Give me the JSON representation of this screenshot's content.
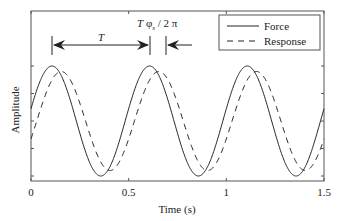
{
  "chart_data": {
    "type": "line",
    "title": "",
    "xlabel": "Time (s)",
    "ylabel": "Amplitude",
    "xlim": [
      0,
      1.5
    ],
    "ylim": [
      -1.1,
      1.1
    ],
    "x_ticks": [
      0,
      0.5,
      1,
      1.5
    ],
    "x_tick_labels": [
      "0",
      "0.5",
      "1",
      "1.5"
    ],
    "y_ticks": [
      -1,
      -0.5,
      0,
      0.5,
      1
    ],
    "y_tick_labels": [],
    "grid": false,
    "legend_position": "upper right",
    "series": [
      {
        "name": "Force",
        "style": "solid",
        "amplitude": 1.0,
        "frequency_hz": 2.0,
        "phase_rad": 0.225,
        "peaks_x": [
          0.107,
          0.61,
          1.11
        ]
      },
      {
        "name": "Response",
        "style": "dashed",
        "amplitude": 0.9,
        "frequency_hz": 2.0,
        "phase_rad": -0.37,
        "peaks_x": [
          0.2,
          0.7,
          1.2
        ]
      }
    ],
    "annotations": [
      {
        "type": "double-arrow",
        "label": "T",
        "x_from": 0.107,
        "x_to": 0.61
      },
      {
        "type": "left-arrow",
        "label": "T φs / 2 π",
        "x_at": 0.69
      }
    ]
  },
  "legend": {
    "items": [
      {
        "label": "Force",
        "style": "solid"
      },
      {
        "label": "Response",
        "style": "dashed"
      }
    ]
  },
  "annotations_text": {
    "period": "T",
    "phase_T": "T",
    "phase_phi": "φ",
    "phase_sub": "s",
    "phase_rest": " / 2 π"
  },
  "colors": {
    "line": "#222222",
    "axis": "#444444"
  }
}
